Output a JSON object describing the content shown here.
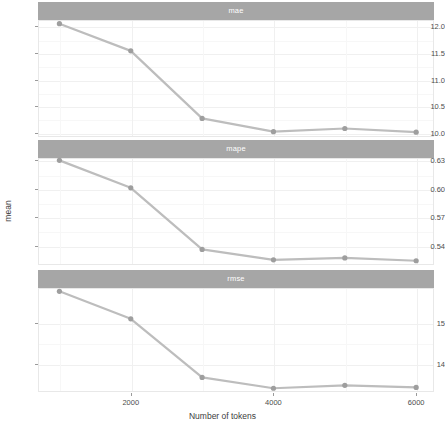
{
  "chart_data": {
    "type": "line",
    "title": "",
    "xlabel": "Number of tokens",
    "ylabel": "mean",
    "x": [
      1000,
      2000,
      3000,
      4000,
      5000,
      6000
    ],
    "xlim": [
      700,
      6250
    ],
    "xticks": [
      2000,
      4000,
      6000
    ],
    "xtick_labels": [
      "2000",
      "4000",
      "6000"
    ],
    "grid": true,
    "legend": null,
    "facets": [
      {
        "label": "mae",
        "values": [
          12.05,
          11.54,
          10.27,
          10.02,
          10.08,
          10.01
        ],
        "yticks": [
          10.0,
          10.5,
          11.0,
          11.5,
          12.0
        ],
        "ytick_labels": [
          "10.0",
          "10.5",
          "11.0",
          "11.5",
          "12.0"
        ],
        "ylim": [
          9.92,
          12.12
        ]
      },
      {
        "label": "mape",
        "values": [
          0.63,
          0.601,
          0.536,
          0.525,
          0.527,
          0.524
        ],
        "yticks": [
          0.54,
          0.57,
          0.6,
          0.63
        ],
        "ytick_labels": [
          "0.54",
          "0.57",
          "0.60",
          "0.63"
        ],
        "ylim": [
          0.5195,
          0.6325
        ]
      },
      {
        "label": "rmse",
        "values": [
          15.75,
          15.09,
          13.68,
          13.42,
          13.49,
          13.44
        ],
        "yticks": [
          14,
          15
        ],
        "ytick_labels": [
          "14",
          "15"
        ],
        "ylim": [
          13.33,
          15.83
        ]
      }
    ],
    "colors": {
      "line": "#bdbdbd",
      "point": "#9e9e9e",
      "strip_background": "#a6a6a6",
      "strip_text": "#ffffff",
      "panel_background": "#ffffff",
      "grid_major": "#f0f0f0",
      "grid_minor": "#f7f7f7",
      "axis_text": "#4d4d4d"
    }
  }
}
